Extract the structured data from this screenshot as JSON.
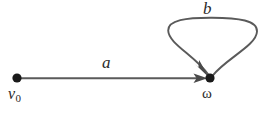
{
  "figure": {
    "type": "directed-graph-diagram",
    "background_color": "#ffffff",
    "stroke_color": "#5a5a5a",
    "node_color": "#1a1a1a",
    "label_color": "#2a2a2a"
  },
  "nodes": [
    {
      "id": "v0",
      "label": "v",
      "subscript": "0",
      "x": 17,
      "y": 78,
      "radius": 4.5
    },
    {
      "id": "omega",
      "label": "ω",
      "x": 210,
      "y": 78,
      "radius": 4.5
    }
  ],
  "edges": [
    {
      "id": "edge-a",
      "label": "a",
      "from": "v0",
      "to": "omega",
      "kind": "straight",
      "directed": true
    },
    {
      "id": "edge-b",
      "label": "b",
      "from": "omega",
      "to": "omega",
      "kind": "self-loop",
      "directed": true
    }
  ]
}
